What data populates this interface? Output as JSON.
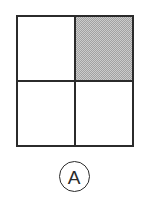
{
  "figure": {
    "kind": "fraction-grid-diagram",
    "label": "A",
    "label_style": "circled",
    "colors": {
      "stroke": "#2b2b2b",
      "shaded_fill": "#a2a2a2",
      "empty_fill": "#ffffff",
      "background": "#ffffff"
    },
    "grid": {
      "rows": 2,
      "columns": 2,
      "total_cells": 4,
      "shaded_cells": 1,
      "cells": [
        {
          "row": 0,
          "column": 0,
          "position": "top-left",
          "shaded": false,
          "fill_label": "white"
        },
        {
          "row": 0,
          "column": 1,
          "position": "top-right",
          "shaded": true,
          "fill_label": "gray"
        },
        {
          "row": 1,
          "column": 0,
          "position": "bottom-left",
          "shaded": false,
          "fill_label": "white"
        },
        {
          "row": 1,
          "column": 1,
          "position": "bottom-right",
          "shaded": false,
          "fill_label": "white"
        }
      ]
    }
  },
  "chart_data": {
    "type": "heatmap",
    "title": "",
    "xlabel": "",
    "ylabel": "",
    "categories": [
      "column-1",
      "column-2"
    ],
    "rows": [
      "row-1",
      "row-2"
    ],
    "values": [
      [
        0,
        1
      ],
      [
        0,
        0
      ]
    ],
    "value_legend": {
      "0": "unshaded (white)",
      "1": "shaded (gray)"
    },
    "annotations": [
      "A"
    ],
    "legend_position": "none",
    "grid": true
  }
}
